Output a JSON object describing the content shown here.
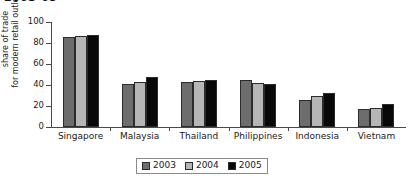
{
  "title_fragment": "2003-05",
  "chart_data": {
    "type": "bar",
    "title": "",
    "xlabel": "",
    "ylabel": "share of trade for modern retail outlets",
    "ylabel_lines": [
      "share of trade",
      "for modern retail outlets"
    ],
    "ylim": [
      0,
      100
    ],
    "yticks": [
      0,
      20,
      40,
      60,
      80,
      100
    ],
    "ytick_labels": [
      "0",
      "20",
      "40",
      "60",
      "80",
      "100"
    ],
    "grid": false,
    "legend_position": "bottom",
    "categories": [
      "Singapore",
      "Malaysia",
      "Thailand",
      "Philippines",
      "Indonesia",
      "Vietnam"
    ],
    "series": [
      {
        "name": "2003",
        "color": "#6d6d6d",
        "values": [
          86,
          41,
          43,
          45,
          26,
          17
        ]
      },
      {
        "name": "2004",
        "color": "#b6b6b6",
        "values": [
          87,
          43,
          44,
          42,
          30,
          18
        ]
      },
      {
        "name": "2005",
        "color": "#080808",
        "values": [
          88,
          48,
          45,
          41,
          32,
          22
        ]
      }
    ]
  },
  "legend": {
    "items": [
      {
        "label": "2003",
        "color": "#6d6d6d"
      },
      {
        "label": "2004",
        "color": "#b6b6b6"
      },
      {
        "label": "2005",
        "color": "#080808"
      }
    ]
  }
}
